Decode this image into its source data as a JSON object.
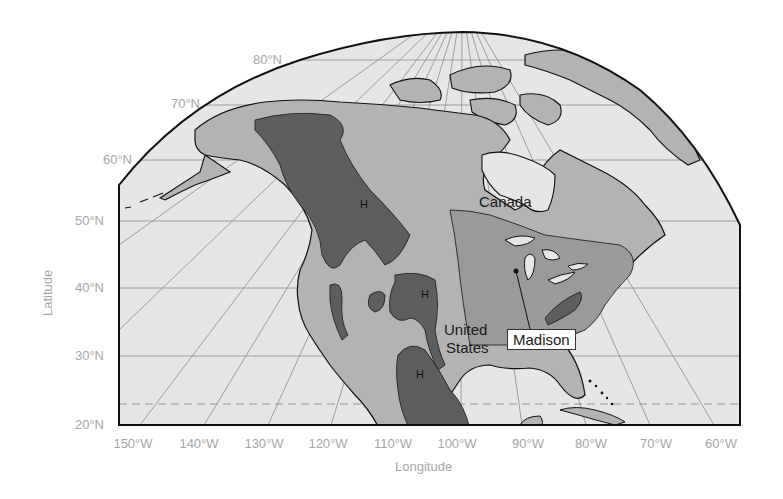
{
  "map": {
    "type": "thematic-map",
    "region": "North America",
    "projection": "conic-like, curved top boundary",
    "colors": {
      "ocean": "#e6e6e6",
      "land_light": "#b3b3b3",
      "land_medium": "#9a9a9a",
      "highlands": "#5e5e5e",
      "coastline": "#111111",
      "graticule": "#8c8c8c",
      "axis_label": "#a6a6a6"
    }
  },
  "axes": {
    "ylabel": "Latitude",
    "xlabel": "Longitude",
    "lat_ticks": [
      "80°N",
      "70°N",
      "60°N",
      "50°N",
      "40°N",
      "30°N",
      "20°N"
    ],
    "lon_ticks": [
      "150°W",
      "140°W",
      "130°W",
      "120°W",
      "110°W",
      "100°W",
      "90°W",
      "80°W",
      "70°W",
      "60°W"
    ]
  },
  "labels": {
    "canada": "Canada",
    "united_states_line1": "United",
    "united_states_line2": "States",
    "madison": "Madison",
    "highlands_marker": "H"
  }
}
